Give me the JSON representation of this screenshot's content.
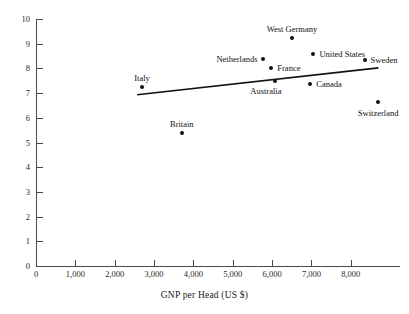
{
  "chart_data": {
    "type": "scatter",
    "title": "",
    "xlabel": "GNP per Head (US $)",
    "ylabel": "",
    "xlim": [
      0,
      9250
    ],
    "ylim": [
      0,
      10
    ],
    "grid": false,
    "legend": null,
    "x_ticks": [
      0,
      1000,
      2000,
      3000,
      4000,
      5000,
      6000,
      7000,
      8000
    ],
    "x_tick_labels": [
      "0",
      "1,000",
      "2,000",
      "3,000",
      "4,000",
      "5,000",
      "6,000",
      "7,000",
      "8,000"
    ],
    "y_ticks": [
      0,
      1,
      2,
      3,
      4,
      5,
      6,
      7,
      8,
      9,
      10
    ],
    "y_tick_labels": [
      "0",
      "1",
      "2",
      "3",
      "4",
      "5",
      "6",
      "7",
      "8",
      "9",
      "10"
    ],
    "points": [
      {
        "label": "Italy",
        "x": 2700,
        "y": 7.25,
        "label_pos": "above"
      },
      {
        "label": "Britain",
        "x": 3710,
        "y": 5.4,
        "label_pos": "above"
      },
      {
        "label": "Netherlands",
        "x": 5780,
        "y": 8.4,
        "label_pos": "left"
      },
      {
        "label": "France",
        "x": 5980,
        "y": 8.0,
        "label_pos": "right"
      },
      {
        "label": "Australia",
        "x": 6080,
        "y": 7.5,
        "label_pos": "below-left"
      },
      {
        "label": "West Germany",
        "x": 6510,
        "y": 9.25,
        "label_pos": "above"
      },
      {
        "label": "United States",
        "x": 7050,
        "y": 8.6,
        "label_pos": "right"
      },
      {
        "label": "Canada",
        "x": 6970,
        "y": 7.35,
        "label_pos": "right"
      },
      {
        "label": "Sweden",
        "x": 8350,
        "y": 8.35,
        "label_pos": "right"
      },
      {
        "label": "Switzerland",
        "x": 8700,
        "y": 6.65,
        "label_pos": "below"
      }
    ],
    "trend_line": {
      "x_start": 2570,
      "y_start": 6.93,
      "x_end": 8700,
      "y_end": 8.02
    }
  },
  "axes": {
    "x_title": "GNP per Head (US $)"
  }
}
